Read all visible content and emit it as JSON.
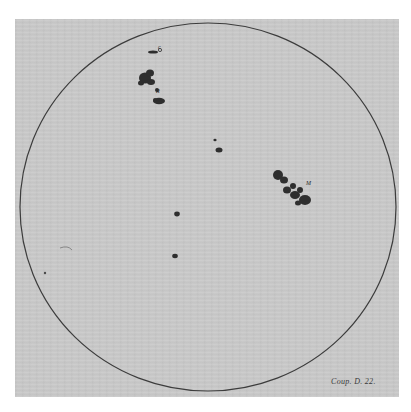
{
  "figure": {
    "colors": {
      "background": "#ffffff",
      "paper": "#c9c9c9",
      "disk_outline": "#3c3c3c",
      "spot": "#2e2e2e"
    },
    "disk": {
      "cx": 208,
      "cy": 207,
      "rx": 188,
      "ry": 184
    },
    "spot_labels": [
      {
        "id": "c",
        "text": "c",
        "x": 158,
        "y": 44
      },
      {
        "id": "r",
        "text": "R",
        "x": 156,
        "y": 88
      },
      {
        "id": "m",
        "text": "M",
        "x": 306,
        "y": 180
      }
    ],
    "signature": "Coup. D. 22."
  }
}
